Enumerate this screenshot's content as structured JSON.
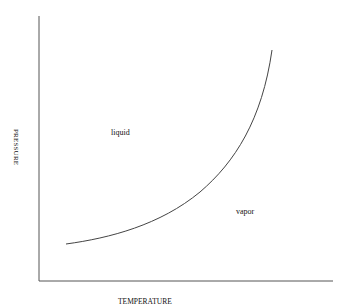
{
  "diagram": {
    "type": "phase-diagram",
    "axes": {
      "xlabel": "TEMPERATURE",
      "ylabel": "PRESSURE"
    },
    "regions": [
      {
        "name": "liquid",
        "label": "liquid"
      },
      {
        "name": "vapor",
        "label": "vapor"
      }
    ],
    "curve": {
      "name": "vapor-pressure-curve",
      "color": "#444444"
    }
  }
}
